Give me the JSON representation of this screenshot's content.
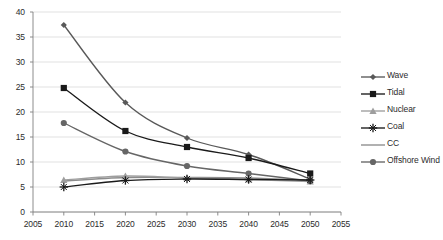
{
  "chart_data": {
    "type": "line",
    "title": "",
    "subtitle": "",
    "xlabel": "",
    "ylabel": "",
    "xlim": [
      2005,
      2055
    ],
    "ylim": [
      0,
      40
    ],
    "x_ticks": [
      "2005",
      "2010",
      "2015",
      "2020",
      "2025",
      "2030",
      "2035",
      "2040",
      "2045",
      "2050",
      "2055"
    ],
    "y_ticks": [
      "0",
      "5",
      "10",
      "15",
      "20",
      "25",
      "30",
      "35",
      "40"
    ],
    "grid": "horizontal",
    "legend_position": "right",
    "x": [
      2010,
      2020,
      2030,
      2040,
      2050
    ],
    "series": [
      {
        "name": "Wave",
        "marker": "diamond",
        "color": "#595959",
        "values": [
          37.4,
          21.9,
          14.8,
          11.5,
          6.6
        ]
      },
      {
        "name": "Tidal",
        "marker": "square",
        "color": "#1a1a1a",
        "values": [
          24.8,
          16.2,
          13.0,
          10.8,
          7.7
        ]
      },
      {
        "name": "Nuclear",
        "marker": "triangle",
        "color": "#9e9e9e",
        "values": [
          6.4,
          7.2,
          6.8,
          6.5,
          6.1
        ]
      },
      {
        "name": "Coal",
        "marker": "plus",
        "color": "#1a1a1a",
        "values": [
          5.0,
          6.3,
          6.6,
          6.5,
          6.4
        ]
      },
      {
        "name": "CC",
        "marker": "none",
        "color": "#8c8c8c",
        "values": [
          6.2,
          6.9,
          6.9,
          6.8,
          6.3
        ]
      },
      {
        "name": "Offshore Wind",
        "marker": "circle",
        "color": "#666666",
        "values": [
          17.8,
          12.1,
          9.2,
          7.7,
          6.2
        ]
      }
    ]
  },
  "legend": {
    "items": [
      {
        "label": "Wave"
      },
      {
        "label": "Tidal"
      },
      {
        "label": "Nuclear"
      },
      {
        "label": "Coal"
      },
      {
        "label": "CC"
      },
      {
        "label": "Offshore Wind"
      }
    ]
  },
  "axes": {
    "y_labels": [
      "40",
      "35",
      "30",
      "25",
      "20",
      "15",
      "10",
      "5",
      "0"
    ],
    "x_labels": [
      "2005",
      "2010",
      "2015",
      "2020",
      "2025",
      "2030",
      "2035",
      "2040",
      "2045",
      "2050",
      "2055"
    ]
  },
  "colors": {
    "grid": "#d9d9d9",
    "axis": "#808080",
    "text": "#2b2b2b",
    "background": "#ffffff"
  }
}
